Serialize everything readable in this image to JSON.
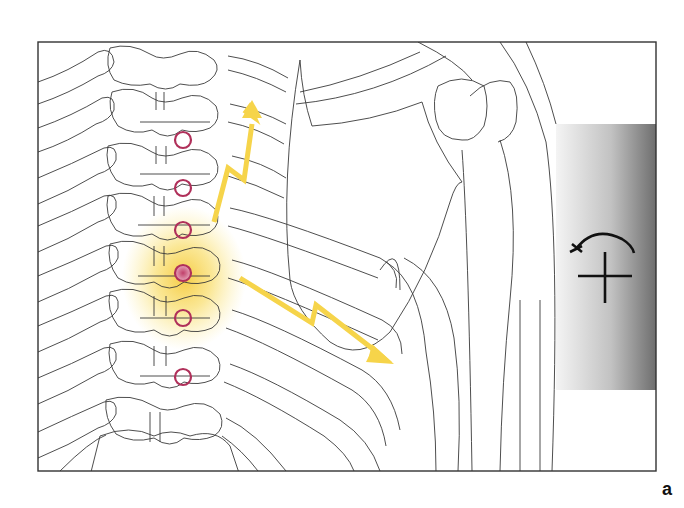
{
  "figure": {
    "panel_label": "a",
    "colors": {
      "outline": "#3a3a3a",
      "frame": "#333333",
      "marker_ring": "#b0305a",
      "marker_active_fill": "#d0708e",
      "glow": "#f7d84a",
      "arrow": "#f6d44a",
      "gray_panel_light": "#f2f2f2",
      "gray_panel_dark": "#7a7a7a",
      "symbol": "#111111"
    },
    "markers": [
      {
        "x": 183,
        "y": 140,
        "active": false
      },
      {
        "x": 183,
        "y": 188,
        "active": false
      },
      {
        "x": 183,
        "y": 230,
        "active": false
      },
      {
        "x": 183,
        "y": 273,
        "active": true
      },
      {
        "x": 183,
        "y": 318,
        "active": false
      },
      {
        "x": 183,
        "y": 377,
        "active": false
      }
    ],
    "arrows": [
      {
        "name": "upward-referral-arrow",
        "direction": "up"
      },
      {
        "name": "lateral-referral-arrow",
        "direction": "down-right"
      }
    ],
    "symbol": {
      "name": "rotation-plus-symbol",
      "meaning": "rotation with mobilization"
    }
  }
}
